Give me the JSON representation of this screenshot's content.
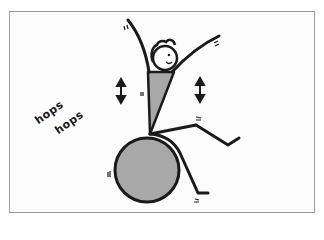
{
  "illustration": {
    "caption_lines": [
      "hops",
      "hops"
    ],
    "colors": {
      "ink": "#1a1a1a",
      "fill": "#a8a8a8",
      "frame": "#9a9a9a",
      "background": "#fcfcfc"
    },
    "subject": "stick figure bouncing on exercise ball"
  }
}
